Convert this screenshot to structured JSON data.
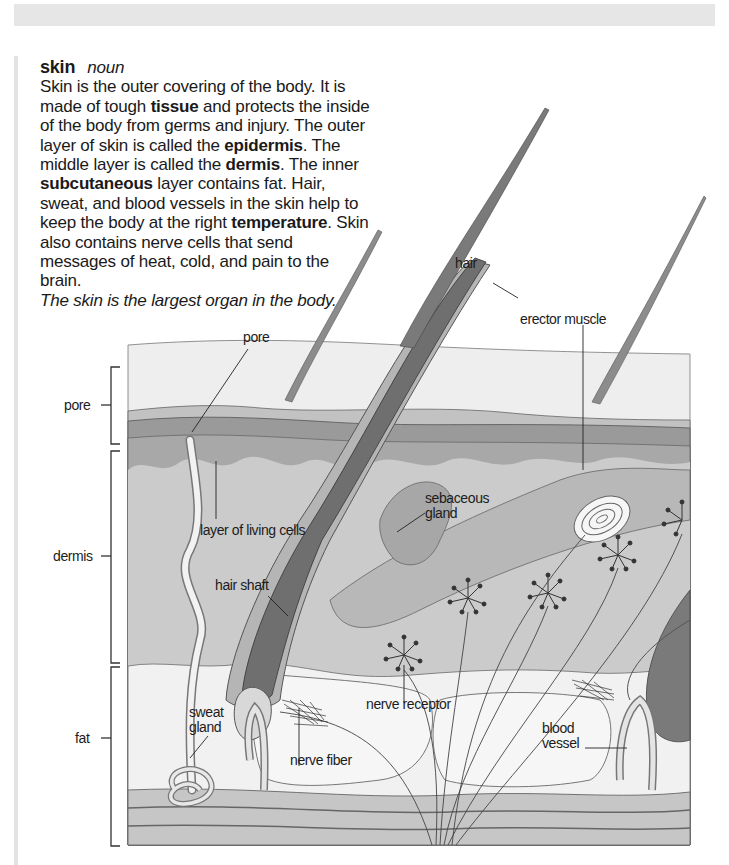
{
  "header_band": {
    "color": "#e6e6e6"
  },
  "entry": {
    "headword": "skin",
    "part_of_speech": "noun",
    "definition_parts": [
      {
        "text": "Skin is the outer covering of the body. It is made of tough ",
        "bold": false
      },
      {
        "text": "tissue",
        "bold": true
      },
      {
        "text": " and protects the inside of the body from germs and injury. The outer layer of skin is called the ",
        "bold": false
      },
      {
        "text": "epidermis",
        "bold": true
      },
      {
        "text": ". The middle layer is called the ",
        "bold": false
      },
      {
        "text": "dermis",
        "bold": true
      },
      {
        "text": ". The inner ",
        "bold": false
      },
      {
        "text": "subcutaneous",
        "bold": true
      },
      {
        "text": " layer contains fat. Hair, sweat, and blood vessels in the skin help to keep the body at the right ",
        "bold": false
      },
      {
        "text": "temperature",
        "bold": true
      },
      {
        "text": ". Skin also contains nerve cells that send messages of heat, cold, and pain to the brain.",
        "bold": false
      }
    ],
    "example": "The skin is the largest organ in the body."
  },
  "diagram": {
    "layer_brackets": [
      {
        "label": "pore"
      },
      {
        "label": "dermis"
      },
      {
        "label": "fat"
      }
    ],
    "callouts": {
      "pore": "pore",
      "hair": "hair",
      "erector_muscle": "erector muscle",
      "layer_of_living_cells": "layer of living cells",
      "sebaceous_gland_1": "sebaceous",
      "sebaceous_gland_2": "gland",
      "hair_shaft": "hair shaft",
      "sweat_gland_1": "sweat",
      "sweat_gland_2": "gland",
      "nerve_receptor": "nerve receptor",
      "nerve_fiber": "nerve fiber",
      "blood_vessel_1": "blood",
      "blood_vessel_2": "vessel"
    },
    "colors": {
      "outer_skin": "#ededed",
      "epidermis_band_light": "#bdbdbd",
      "epidermis_band_dark": "#8f8f8f",
      "dermis": "#c8c8c8",
      "fat": "#f2f2f2",
      "follicle": "#7a7a7a",
      "hair": "#8a8a8a"
    }
  }
}
